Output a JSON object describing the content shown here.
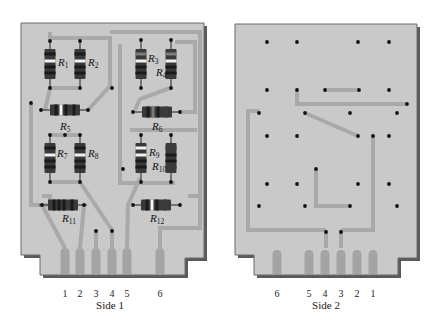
{
  "colors": {
    "board": "#c9c9c9",
    "board_border": "#6a6a6a",
    "board_shadow": "#5a5a5a",
    "trace": "#a9a9a9",
    "pad": "#a4a4a4",
    "via": "#111111",
    "resistor_body": "#3a3a3a",
    "band_dark": "#1a1a1a",
    "band_light": "#f2f2f2",
    "band_mid": "#7a7a7a",
    "background": "#ffffff"
  },
  "boards": [
    {
      "id": "side1",
      "caption": "Side 1",
      "caption_pos": [
        110,
        299
      ],
      "outline": [
        [
          21,
          23
        ],
        [
          204,
          23
        ],
        [
          204,
          258
        ],
        [
          185,
          258
        ],
        [
          185,
          275
        ],
        [
          40,
          275
        ],
        [
          40,
          255
        ],
        [
          21,
          255
        ]
      ],
      "pins": [
        {
          "label": "1",
          "x": 65,
          "finger_x": 65
        },
        {
          "label": "2",
          "x": 80,
          "finger_x": 80
        },
        {
          "label": "3",
          "x": 96,
          "finger_x": 96
        },
        {
          "label": "4",
          "x": 112,
          "finger_x": 112
        },
        {
          "label": "5",
          "x": 127,
          "finger_x": 127
        },
        {
          "label": "6",
          "x": 160,
          "finger_x": 160
        }
      ],
      "pin_label_y": 287,
      "finger_top": 248,
      "finger_bottom": 274,
      "traces": [
        [
          [
            50,
            32
          ],
          [
            50,
            38
          ],
          [
            80,
            38
          ]
        ],
        [
          [
            80,
            38
          ],
          [
            110,
            38
          ],
          [
            110,
            86
          ],
          [
            88,
            110
          ]
        ],
        [
          [
            110,
            32
          ],
          [
            200,
            32
          ],
          [
            200,
            200
          ]
        ],
        [
          [
            80,
            38
          ],
          [
            80,
            40
          ]
        ],
        [
          [
            80,
            88
          ],
          [
            50,
            88
          ],
          [
            45,
            110
          ]
        ],
        [
          [
            120,
            44
          ],
          [
            120,
            183
          ],
          [
            150,
            183
          ]
        ],
        [
          [
            175,
            42
          ],
          [
            195,
            42
          ],
          [
            195,
            112
          ],
          [
            180,
            112
          ]
        ],
        [
          [
            170,
            88
          ],
          [
            140,
            99
          ],
          [
            135,
            110
          ]
        ],
        [
          [
            200,
            200
          ],
          [
            200,
            228
          ],
          [
            160,
            228
          ],
          [
            160,
            248
          ]
        ],
        [
          [
            31,
            103
          ],
          [
            31,
            205
          ],
          [
            50,
            205
          ],
          [
            50,
            196
          ],
          [
            42,
            196
          ]
        ],
        [
          [
            50,
            135
          ],
          [
            80,
            135
          ]
        ],
        [
          [
            50,
            182
          ],
          [
            80,
            182
          ]
        ],
        [
          [
            80,
            182
          ],
          [
            112,
            230
          ],
          [
            112,
            248
          ]
        ],
        [
          [
            42,
            205
          ],
          [
            65,
            248
          ]
        ],
        [
          [
            84,
            205
          ],
          [
            80,
            248
          ]
        ],
        [
          [
            140,
            178
          ],
          [
            128,
            205
          ],
          [
            127,
            248
          ]
        ],
        [
          [
            130,
            130
          ],
          [
            197,
            130
          ]
        ],
        [
          [
            140,
            183
          ],
          [
            175,
            183
          ]
        ],
        [
          [
            96,
            230
          ],
          [
            96,
            248
          ]
        ],
        [
          [
            188,
            196
          ],
          [
            198,
            196
          ]
        ]
      ],
      "vias": [
        [
          50,
          41
        ],
        [
          80,
          41
        ],
        [
          50,
          88
        ],
        [
          80,
          88
        ],
        [
          31,
          103
        ],
        [
          112,
          88
        ],
        [
          141,
          40
        ],
        [
          171,
          40
        ],
        [
          141,
          88
        ],
        [
          171,
          88
        ],
        [
          41,
          110
        ],
        [
          88,
          110
        ],
        [
          133,
          112
        ],
        [
          180,
          112
        ],
        [
          50,
          135
        ],
        [
          65,
          135
        ],
        [
          80,
          135
        ],
        [
          50,
          182
        ],
        [
          80,
          182
        ],
        [
          141,
          135
        ],
        [
          171,
          135
        ],
        [
          123,
          169
        ],
        [
          141,
          182
        ],
        [
          171,
          182
        ],
        [
          42,
          205
        ],
        [
          84,
          205
        ],
        [
          133,
          205
        ],
        [
          180,
          205
        ],
        [
          96,
          231
        ],
        [
          112,
          231
        ]
      ],
      "resistors": [
        {
          "name": "R",
          "sub": "1",
          "orient": "v",
          "cx": 50,
          "cy": 64,
          "bands": [
            "#1a1a1a",
            "#f2f2f2",
            "#1a1a1a",
            "#1a1a1a"
          ],
          "label_pos": [
            58,
            66
          ]
        },
        {
          "name": "R",
          "sub": "2",
          "orient": "v",
          "cx": 80,
          "cy": 64,
          "bands": [
            "#1a1a1a",
            "#f2f2f2",
            "#1a1a1a",
            "#1a1a1a"
          ],
          "label_pos": [
            88,
            66
          ]
        },
        {
          "name": "R",
          "sub": "3",
          "orient": "v",
          "cx": 141,
          "cy": 64,
          "bands": [
            "#7a7a7a",
            "#f2f2f2",
            "#1a1a1a",
            "#1a1a1a"
          ],
          "label_pos": [
            148,
            62
          ]
        },
        {
          "name": "R",
          "sub": "4",
          "orient": "v",
          "cx": 171,
          "cy": 64,
          "bands": [
            "#7a7a7a",
            "#f2f2f2",
            "#1a1a1a",
            "#1a1a1a"
          ],
          "label_pos": [
            156,
            76
          ]
        },
        {
          "name": "R",
          "sub": "5",
          "orient": "h",
          "cx": 65,
          "cy": 110,
          "bands": [
            "#1a1a1a",
            "#f2f2f2",
            "#1a1a1a",
            "#1a1a1a"
          ],
          "label_pos": [
            60,
            130
          ]
        },
        {
          "name": "R",
          "sub": "6",
          "orient": "h",
          "cx": 157,
          "cy": 112,
          "bands": [
            "#1a1a1a",
            "#7a7a7a",
            "#1a1a1a",
            "#3a3a3a"
          ],
          "label_pos": [
            152,
            130
          ]
        },
        {
          "name": "R",
          "sub": "7",
          "orient": "v",
          "cx": 50,
          "cy": 158,
          "bands": [
            "#1a1a1a",
            "#f2f2f2",
            "#1a1a1a",
            "#1a1a1a"
          ],
          "label_pos": [
            57,
            157
          ]
        },
        {
          "name": "R",
          "sub": "8",
          "orient": "v",
          "cx": 80,
          "cy": 158,
          "bands": [
            "#1a1a1a",
            "#f2f2f2",
            "#1a1a1a",
            "#1a1a1a"
          ],
          "label_pos": [
            88,
            157
          ]
        },
        {
          "name": "R",
          "sub": "9",
          "orient": "v",
          "cx": 141,
          "cy": 158,
          "bands": [
            "#f2f2f2",
            "#f2f2f2",
            "#1a1a1a",
            "#1a1a1a"
          ],
          "label_pos": [
            149,
            156
          ]
        },
        {
          "name": "R",
          "sub": "10",
          "orient": "v",
          "cx": 171,
          "cy": 158,
          "bands": [
            "#3a3a3a",
            "#1a1a1a",
            "#1a1a1a",
            "#3a3a3a"
          ],
          "label_pos": [
            152,
            170
          ]
        },
        {
          "name": "R",
          "sub": "11",
          "orient": "h",
          "cx": 63,
          "cy": 205,
          "bands": [
            "#1a1a1a",
            "#1a1a1a",
            "#1a1a1a",
            "#1a1a1a"
          ],
          "label_pos": [
            62,
            222
          ]
        },
        {
          "name": "R",
          "sub": "12",
          "orient": "h",
          "cx": 156,
          "cy": 205,
          "bands": [
            "#1a1a1a",
            "#f2f2f2",
            "#1a1a1a",
            "#3a3a3a"
          ],
          "label_pos": [
            150,
            222
          ]
        }
      ]
    },
    {
      "id": "side2",
      "caption": "Side 2",
      "caption_pos": [
        326,
        299
      ],
      "outline": [
        [
          235,
          24
        ],
        [
          417,
          24
        ],
        [
          417,
          258
        ],
        [
          398,
          258
        ],
        [
          398,
          275
        ],
        [
          254,
          275
        ],
        [
          254,
          255
        ],
        [
          235,
          255
        ]
      ],
      "pins": [
        {
          "label": "6",
          "x": 277,
          "finger_x": 277
        },
        {
          "label": "5",
          "x": 309,
          "finger_x": 309
        },
        {
          "label": "4",
          "x": 325,
          "finger_x": 325
        },
        {
          "label": "3",
          "x": 341,
          "finger_x": 341
        },
        {
          "label": "2",
          "x": 357,
          "finger_x": 357
        },
        {
          "label": "1",
          "x": 373,
          "finger_x": 373
        }
      ],
      "pin_label_y": 287,
      "finger_top": 250,
      "finger_bottom": 274,
      "traces": [
        [
          [
            326,
            230
          ],
          [
            248,
            230
          ],
          [
            248,
            111
          ],
          [
            259,
            111
          ]
        ],
        [
          [
            341,
            230
          ],
          [
            373,
            230
          ],
          [
            373,
            139
          ],
          [
            373,
            136
          ]
        ],
        [
          [
            326,
            230
          ],
          [
            326,
            248
          ]
        ],
        [
          [
            341,
            230
          ],
          [
            341,
            248
          ]
        ],
        [
          [
            297,
            90
          ],
          [
            297,
            104
          ],
          [
            407,
            104
          ]
        ],
        [
          [
            325,
            90
          ],
          [
            359,
            90
          ]
        ],
        [
          [
            305,
            113
          ],
          [
            358,
            136
          ]
        ],
        [
          [
            316,
            169
          ],
          [
            316,
            206
          ],
          [
            350,
            206
          ]
        ]
      ],
      "vias": [
        [
          267,
          42
        ],
        [
          297,
          42
        ],
        [
          358,
          42
        ],
        [
          389,
          42
        ],
        [
          267,
          90
        ],
        [
          297,
          90
        ],
        [
          325,
          90
        ],
        [
          359,
          90
        ],
        [
          389,
          90
        ],
        [
          259,
          113
        ],
        [
          305,
          113
        ],
        [
          350,
          113
        ],
        [
          397,
          113
        ],
        [
          407,
          104
        ],
        [
          267,
          136
        ],
        [
          297,
          136
        ],
        [
          358,
          136
        ],
        [
          373,
          136
        ],
        [
          389,
          136
        ],
        [
          316,
          169
        ],
        [
          267,
          184
        ],
        [
          297,
          184
        ],
        [
          358,
          184
        ],
        [
          389,
          184
        ],
        [
          259,
          206
        ],
        [
          305,
          206
        ],
        [
          350,
          206
        ],
        [
          397,
          206
        ],
        [
          326,
          232
        ],
        [
          341,
          232
        ]
      ],
      "resistors": []
    }
  ]
}
